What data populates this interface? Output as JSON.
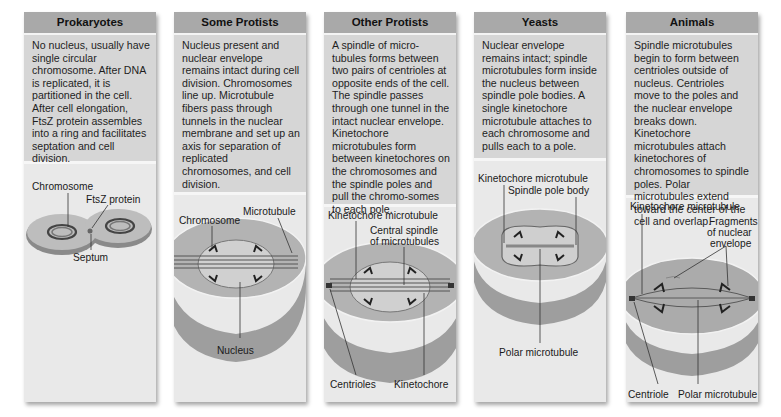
{
  "panels": [
    {
      "title": "Prokaryotes",
      "text": "No nucleus, usually have single circular chromosome. After DNA is replicated, it is partitioned in the cell. After cell elongation, FtsZ protein assembles into a ring and facilitates septation and cell division.",
      "labels": {
        "chromosome": "Chromosome",
        "ftsz": "FtsZ protein",
        "septum": "Septum"
      }
    },
    {
      "title": "Some Protists",
      "text": "Nucleus present and nuclear envelope remains intact during cell division. Chromosomes line up. Microtubule fibers pass through tunnels in the nuclear membrane and set up an axis for separation of replicated chromosomes, and cell division.",
      "labels": {
        "microtubule": "Microtubule",
        "chromosome": "Chromosome",
        "nucleus": "Nucleus"
      }
    },
    {
      "title": "Other Protists",
      "text": "A spindle of micro-tubules forms between two pairs of centrioles at opposite ends of the cell. The spindle passes through one tunnel in the intact nuclear envelope. Kinetochore microtubules form between kinetochores on the chromosomes and the spindle poles and pull the chromo-somes to each pole.",
      "labels": {
        "kinetochore_microtubule": "Kinetochore microtubule",
        "central_spindle_1": "Central spindle",
        "central_spindle_2": "of microtubules",
        "centrioles": "Centrioles",
        "kinetochore": "Kinetochore"
      }
    },
    {
      "title": "Yeasts",
      "text": "Nuclear envelope remains intact; spindle microtubules form inside the nucleus between spindle pole bodies. A single kinetochore microtubule attaches to each chromosome and pulls each to a pole.",
      "labels": {
        "kinetochore_microtubule": "Kinetochore microtubule",
        "spindle_pole_body": "Spindle pole body",
        "polar_microtubule": "Polar microtubule"
      }
    },
    {
      "title": "Animals",
      "text": "Spindle microtubules begin to form between centrioles outside of nucleus. Centrioles move to the poles and the nuclear envelope breaks down. Kinetochore microtubules attach kinetochores of chromosomes to spindle poles. Polar microtubules extend toward the center of the cell and overlap.",
      "labels": {
        "kinetochore_microtubule": "Kinetochore microtubule",
        "fragments_1": "Fragments",
        "fragments_2": "of nuclear",
        "fragments_3": "envelope",
        "centriole": "Centriole",
        "polar_microtubule": "Polar microtubule"
      }
    }
  ]
}
